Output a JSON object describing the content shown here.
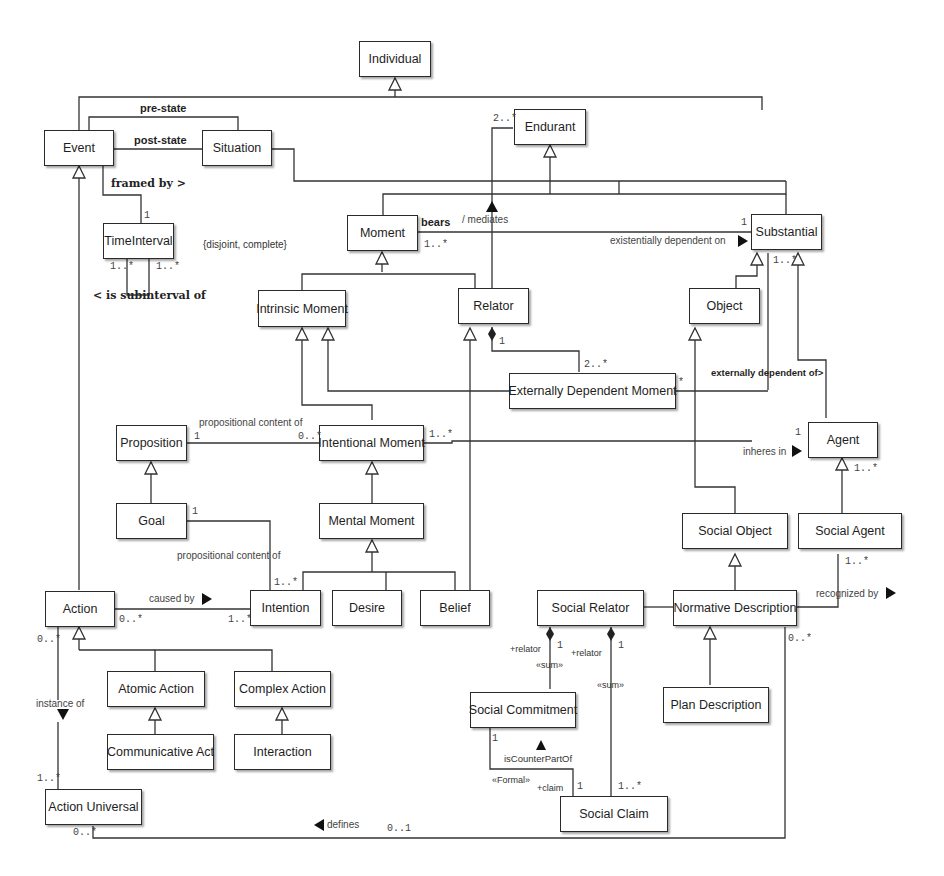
{
  "diagram": {
    "type": "UML class diagram",
    "colors": {
      "line": "#333333",
      "box_border": "#2a2a2a",
      "text": "#1e1e1e",
      "background": "#ffffff"
    },
    "classes": {
      "individual": "Individual",
      "event": "Event",
      "situation": "Situation",
      "endurant": "Endurant",
      "time_interval": "TimeInterval",
      "moment": "Moment",
      "substantial": "Substantial",
      "intrinsic_moment": "Intrinsic Moment",
      "relator": "Relator",
      "object": "Object",
      "externally_dependent_moment": "Externally Dependent Moment",
      "proposition": "Proposition",
      "intentional_moment": "Intentional Moment",
      "agent": "Agent",
      "goal": "Goal",
      "mental_moment": "Mental Moment",
      "social_object": "Social Object",
      "social_agent": "Social Agent",
      "action": "Action",
      "intention": "Intention",
      "desire": "Desire",
      "belief": "Belief",
      "social_relator": "Social Relator",
      "normative_description": "Normative Description",
      "atomic_action": "Atomic Action",
      "complex_action": "Complex Action",
      "social_commitment": "Social Commitment",
      "plan_description": "Plan Description",
      "communicative_act": "Communicative Act",
      "interaction": "Interaction",
      "action_universal": "Action Universal",
      "social_claim": "Social Claim"
    },
    "labels": {
      "pre_state": "pre-state",
      "post_state": "post-state",
      "framed_by": "framed by >",
      "disjoint_complete": "{disjoint, complete}",
      "is_subinterval_of": "< is subinterval of",
      "bears": "bears",
      "mediates": "/ mediates",
      "existentially_dependent_on": "existentially dependent on",
      "externally_dependent_of": "externally dependent of>",
      "propositional_content_of_1": "propositional content of",
      "propositional_content_of_2": "propositional content of",
      "inheres_in": "inheres in",
      "caused_by": "caused by",
      "recognized_by": "recognized by",
      "instance_of": "instance of",
      "defines": "defines",
      "relator_role_1": "+relator",
      "relator_role_2": "+relator",
      "sum_1": "«sum»",
      "sum_2": "«sum»",
      "is_counter_part_of": "isCounterPartOf",
      "formal": "«Formal»",
      "claim_role": "+claim"
    },
    "multiplicities": {
      "time_interval_top": "1",
      "time_interval_left": "1..*",
      "time_interval_right": "1..*",
      "endurant_mediates": "2..*",
      "moment_bears": "1..*",
      "substantial_bears": "1",
      "substantial_agent": "1..*",
      "relator_edm": "1",
      "edm_relator": "2..*",
      "edm_right": "*",
      "proposition_pc": "1",
      "intentional_pc": "0..*",
      "intentional_inheres": "1..*",
      "agent_inheres": "1",
      "agent_social": "1..*",
      "goal_pc": "1",
      "intention_pc": "1..*",
      "action_caused": "0..*",
      "intention_caused": "1..*",
      "action_instance": "0..*",
      "social_agent_recognized": "1..*",
      "social_relator_1": "1",
      "social_relator_2": "1",
      "normative_defines": "0..*",
      "social_commitment_1": "1",
      "social_claim_1": "1",
      "social_claim_many": "1..*",
      "action_universal_instance": "1..*",
      "action_universal_defines": "0..*",
      "defines_target": "0..1"
    }
  }
}
